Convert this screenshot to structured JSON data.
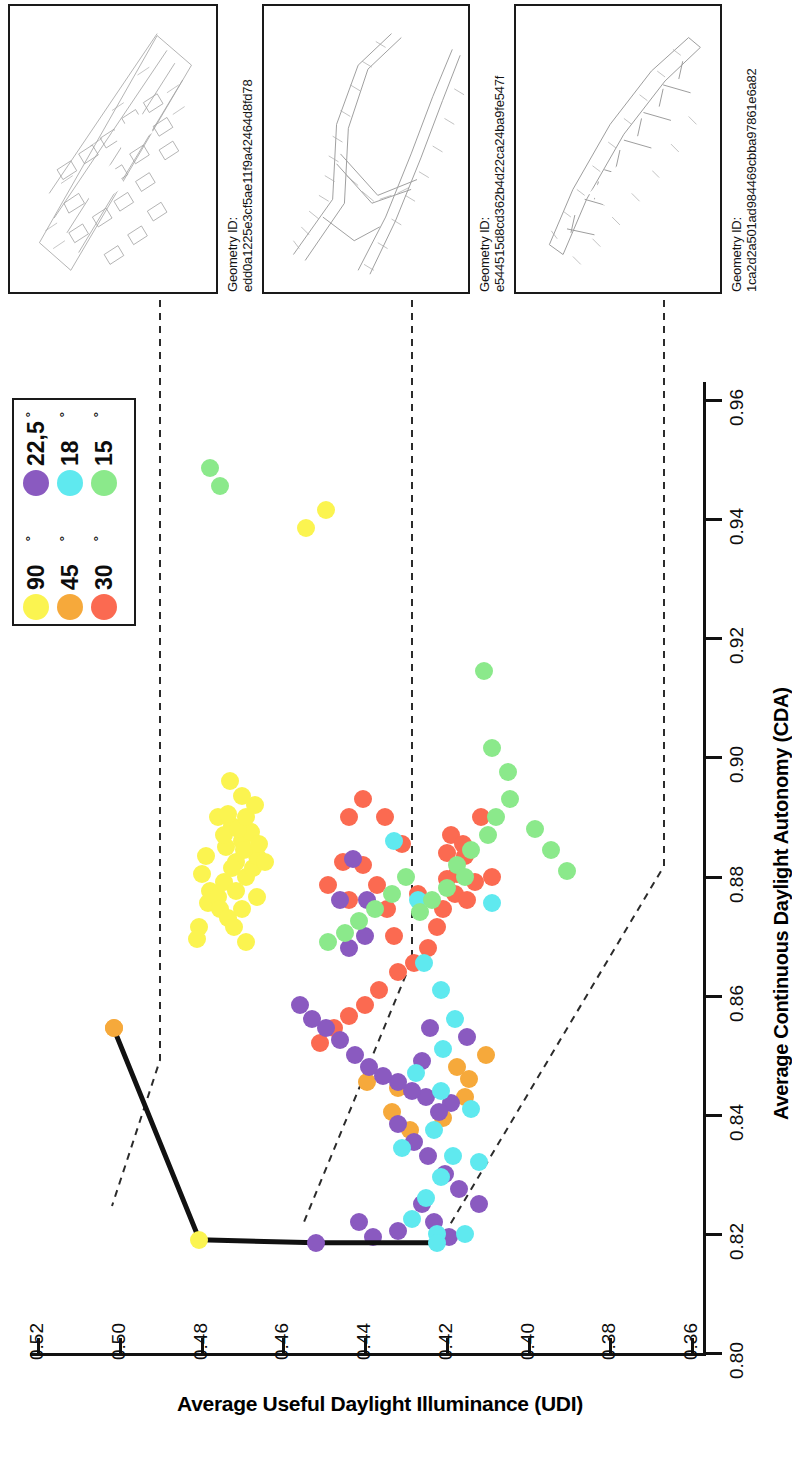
{
  "chart_data": {
    "type": "scatter",
    "title": "",
    "xlabel": "Average Continuous Daylight Autonomy (CDA)",
    "ylabel": "Average Useful Daylight Illuminance (UDI)",
    "orientation": "rotated-90-clockwise",
    "xlim": [
      0.8,
      0.96
    ],
    "ylim": [
      0.36,
      0.52
    ],
    "xticks": [
      "0.80",
      "0.82",
      "0.84",
      "0.86",
      "0.88",
      "0.90",
      "0.92",
      "0.94",
      "0.96"
    ],
    "yticks": [
      "0.52",
      "0.50",
      "0.48",
      "0.46",
      "0.44",
      "0.42",
      "0.40",
      "0.38",
      "0.36"
    ],
    "grid": false,
    "legend_position": "top-left",
    "series": [
      {
        "name": "90 °",
        "color": "#FBF450",
        "points": [
          [
            0.8715,
            0.4805
          ],
          [
            0.8755,
            0.4785
          ],
          [
            0.8775,
            0.478
          ],
          [
            0.8765,
            0.476
          ],
          [
            0.8745,
            0.4755
          ],
          [
            0.879,
            0.4745
          ],
          [
            0.873,
            0.4735
          ],
          [
            0.8715,
            0.472
          ],
          [
            0.8775,
            0.4715
          ],
          [
            0.8745,
            0.47
          ],
          [
            0.88,
            0.469
          ],
          [
            0.8815,
            0.4675
          ],
          [
            0.8835,
            0.4665
          ],
          [
            0.8825,
            0.4715
          ],
          [
            0.886,
            0.47
          ],
          [
            0.8875,
            0.468
          ],
          [
            0.8885,
            0.4725
          ],
          [
            0.885,
            0.474
          ],
          [
            0.89,
            0.476
          ],
          [
            0.8835,
            0.479
          ],
          [
            0.8805,
            0.48
          ],
          [
            0.887,
            0.4745
          ],
          [
            0.888,
            0.471
          ],
          [
            0.8845,
            0.4695
          ],
          [
            0.8815,
            0.4725
          ],
          [
            0.89,
            0.469
          ],
          [
            0.892,
            0.467
          ],
          [
            0.869,
            0.469
          ],
          [
            0.8935,
            0.47
          ],
          [
            0.8905,
            0.4735
          ],
          [
            0.8855,
            0.466
          ],
          [
            0.8765,
            0.4665
          ],
          [
            0.8825,
            0.4645
          ],
          [
            0.9385,
            0.4545
          ],
          [
            0.9415,
            0.4495
          ],
          [
            0.8695,
            0.481
          ],
          [
            0.896,
            0.473
          ]
        ]
      },
      {
        "name": "45 °",
        "color": "#F6A93B",
        "points": [
          [
            0.8545,
            0.5015
          ],
          [
            0.8455,
            0.4395
          ],
          [
            0.8445,
            0.432
          ],
          [
            0.8405,
            0.4335
          ],
          [
            0.8375,
            0.429
          ],
          [
            0.848,
            0.4175
          ],
          [
            0.846,
            0.4145
          ],
          [
            0.843,
            0.4155
          ],
          [
            0.85,
            0.4105
          ],
          [
            0.8395,
            0.421
          ]
        ]
      },
      {
        "name": "30 °",
        "color": "#FB6A51",
        "points": [
          [
            0.89,
            0.4115
          ],
          [
            0.887,
            0.419
          ],
          [
            0.8855,
            0.416
          ],
          [
            0.884,
            0.42
          ],
          [
            0.8835,
            0.4155
          ],
          [
            0.8805,
            0.4175
          ],
          [
            0.8795,
            0.42
          ],
          [
            0.879,
            0.413
          ],
          [
            0.88,
            0.409
          ],
          [
            0.877,
            0.418
          ],
          [
            0.8745,
            0.421
          ],
          [
            0.876,
            0.415
          ],
          [
            0.8715,
            0.4225
          ],
          [
            0.868,
            0.4245
          ],
          [
            0.8655,
            0.428
          ],
          [
            0.864,
            0.432
          ],
          [
            0.87,
            0.433
          ],
          [
            0.8745,
            0.4345
          ],
          [
            0.8785,
            0.437
          ],
          [
            0.882,
            0.4405
          ],
          [
            0.876,
            0.444
          ],
          [
            0.8825,
            0.4455
          ],
          [
            0.8785,
            0.449
          ],
          [
            0.89,
            0.444
          ],
          [
            0.893,
            0.4405
          ],
          [
            0.861,
            0.4365
          ],
          [
            0.8585,
            0.44
          ],
          [
            0.8565,
            0.444
          ],
          [
            0.8545,
            0.4475
          ],
          [
            0.852,
            0.451
          ],
          [
            0.89,
            0.435
          ],
          [
            0.8855,
            0.431
          ],
          [
            0.877,
            0.427
          ]
        ]
      },
      {
        "name": "22,5 °",
        "color": "#8A5AC0",
        "points": [
          [
            0.842,
            0.419
          ],
          [
            0.8405,
            0.422
          ],
          [
            0.843,
            0.425
          ],
          [
            0.844,
            0.4285
          ],
          [
            0.8455,
            0.432
          ],
          [
            0.8465,
            0.4355
          ],
          [
            0.848,
            0.439
          ],
          [
            0.85,
            0.4425
          ],
          [
            0.8525,
            0.446
          ],
          [
            0.8545,
            0.4495
          ],
          [
            0.856,
            0.453
          ],
          [
            0.8585,
            0.456
          ],
          [
            0.8275,
            0.417
          ],
          [
            0.83,
            0.4205
          ],
          [
            0.833,
            0.4245
          ],
          [
            0.8355,
            0.428
          ],
          [
            0.8385,
            0.432
          ],
          [
            0.825,
            0.426
          ],
          [
            0.822,
            0.423
          ],
          [
            0.8195,
            0.4195
          ],
          [
            0.87,
            0.44
          ],
          [
            0.876,
            0.4395
          ],
          [
            0.883,
            0.443
          ],
          [
            0.876,
            0.446
          ],
          [
            0.868,
            0.444
          ],
          [
            0.8545,
            0.424
          ],
          [
            0.849,
            0.426
          ],
          [
            0.853,
            0.415
          ],
          [
            0.825,
            0.412
          ],
          [
            0.8205,
            0.432
          ],
          [
            0.8195,
            0.438
          ],
          [
            0.822,
            0.4415
          ]
        ]
      },
      {
        "name": "18 °",
        "color": "#5FE9EF",
        "points": [
          [
            0.833,
            0.4185
          ],
          [
            0.8295,
            0.4215
          ],
          [
            0.826,
            0.425
          ],
          [
            0.8225,
            0.4285
          ],
          [
            0.82,
            0.4225
          ],
          [
            0.8345,
            0.431
          ],
          [
            0.8375,
            0.423
          ],
          [
            0.841,
            0.414
          ],
          [
            0.844,
            0.4215
          ],
          [
            0.847,
            0.4275
          ],
          [
            0.851,
            0.421
          ],
          [
            0.856,
            0.418
          ],
          [
            0.861,
            0.4215
          ],
          [
            0.8655,
            0.4255
          ],
          [
            0.876,
            0.427
          ],
          [
            0.886,
            0.433
          ],
          [
            0.8755,
            0.409
          ],
          [
            0.82,
            0.4155
          ],
          [
            0.832,
            0.412
          ]
        ]
      },
      {
        "name": "15 °",
        "color": "#8BE98B",
        "points": [
          [
            0.9145,
            0.411
          ],
          [
            0.9015,
            0.409
          ],
          [
            0.8975,
            0.405
          ],
          [
            0.893,
            0.4045
          ],
          [
            0.89,
            0.408
          ],
          [
            0.887,
            0.41
          ],
          [
            0.8845,
            0.414
          ],
          [
            0.882,
            0.4175
          ],
          [
            0.88,
            0.4155
          ],
          [
            0.878,
            0.42
          ],
          [
            0.876,
            0.4235
          ],
          [
            0.874,
            0.4265
          ],
          [
            0.88,
            0.43
          ],
          [
            0.877,
            0.4335
          ],
          [
            0.8745,
            0.4375
          ],
          [
            0.8725,
            0.4415
          ],
          [
            0.8705,
            0.445
          ],
          [
            0.869,
            0.449
          ],
          [
            0.9485,
            0.478
          ],
          [
            0.9455,
            0.4755
          ],
          [
            0.888,
            0.3985
          ],
          [
            0.8845,
            0.3945
          ],
          [
            0.881,
            0.3905
          ]
        ]
      }
    ],
    "pareto_front": {
      "name": "Pareto front",
      "color": "#111111",
      "points": [
        [
          0.8545,
          0.5015
        ],
        [
          0.819,
          0.4805
        ],
        [
          0.8185,
          0.452
        ],
        [
          0.8185,
          0.4225
        ]
      ]
    },
    "callouts": [
      {
        "geometry_id_label": "Geometry ID:",
        "geometry_id": "edd0a1225e3cf5ae11f9a42464d8fd78",
        "anchor_cda": 0.819,
        "anchor_udi": 0.4805
      },
      {
        "geometry_id_label": "Geometry ID:",
        "geometry_id": "e544515d8cd362b4d22ca24ba9fe547f",
        "anchor_cda": 0.8185,
        "anchor_udi": 0.452
      },
      {
        "geometry_id_label": "Geometry ID:",
        "geometry_id": "1ca2d2a501ad984469cbba97861e6a82",
        "anchor_cda": 0.8185,
        "anchor_udi": 0.4225
      }
    ]
  },
  "legend": {
    "items": [
      {
        "label": "90",
        "degree": "°",
        "color": "#FBF450"
      },
      {
        "label": "45",
        "degree": "°",
        "color": "#F6A93B"
      },
      {
        "label": "30",
        "degree": "°",
        "color": "#FB6A51"
      },
      {
        "label": "22,5",
        "degree": "°",
        "color": "#8A5AC0"
      },
      {
        "label": "18",
        "degree": "°",
        "color": "#5FE9EF"
      },
      {
        "label": "15",
        "degree": "°",
        "color": "#8BE98B"
      }
    ]
  },
  "axes": {
    "x_title": "Average Continuous Daylight Autonomy (CDA)",
    "y_title": "Average Useful Daylight Illuminance (UDI)",
    "x_ticks": [
      "0.80",
      "0.82",
      "0.84",
      "0.86",
      "0.88",
      "0.90",
      "0.92",
      "0.94",
      "0.96"
    ],
    "y_ticks": [
      "0.52",
      "0.50",
      "0.48",
      "0.46",
      "0.44",
      "0.42",
      "0.40",
      "0.38",
      "0.36"
    ]
  },
  "callout_boxes": [
    {
      "id_label": "Geometry ID:",
      "id_value": "edd0a1225e3cf5ae11f9a42464d8fd78"
    },
    {
      "id_label": "Geometry ID:",
      "id_value": "e544515d8cd362b4d22ca24ba9fe547f"
    },
    {
      "id_label": "Geometry ID:",
      "id_value": "1ca2d2a501ad984469cbba97861e6a82"
    }
  ]
}
